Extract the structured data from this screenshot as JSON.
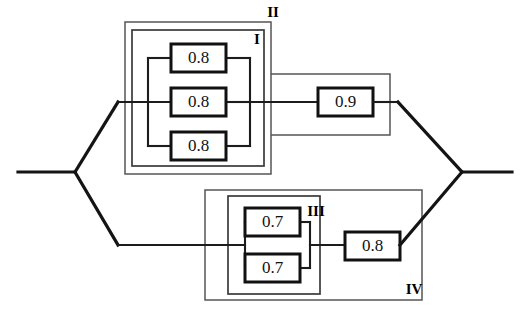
{
  "diagram": {
    "type": "reliability-block-diagram",
    "background_color": "#ffffff",
    "line_color": "#111111",
    "boundary_color": "#3a3a3a",
    "blocks": [
      {
        "id": "b1",
        "label": "0.8",
        "value": 0.8,
        "x": 171,
        "y": 44,
        "w": 55,
        "h": 28,
        "group": "I"
      },
      {
        "id": "b2",
        "label": "0.8",
        "value": 0.8,
        "x": 171,
        "y": 88,
        "w": 55,
        "h": 28,
        "group": "I"
      },
      {
        "id": "b3",
        "label": "0.8",
        "value": 0.8,
        "x": 171,
        "y": 132,
        "w": 55,
        "h": 28,
        "group": "I"
      },
      {
        "id": "b4",
        "label": "0.9",
        "value": 0.9,
        "x": 318,
        "y": 88,
        "w": 55,
        "h": 28,
        "group": "II"
      },
      {
        "id": "b5",
        "label": "0.7",
        "value": 0.7,
        "x": 245,
        "y": 208,
        "w": 55,
        "h": 28,
        "group": "III"
      },
      {
        "id": "b6",
        "label": "0.7",
        "value": 0.7,
        "x": 245,
        "y": 254,
        "w": 55,
        "h": 28,
        "group": "III"
      },
      {
        "id": "b7",
        "label": "0.8",
        "value": 0.8,
        "x": 345,
        "y": 232,
        "w": 55,
        "h": 28,
        "group": "IV"
      }
    ],
    "group_labels": [
      {
        "id": "I",
        "text": "I",
        "x": 257,
        "y": 41,
        "describes": "parallel set of three 0.8 blocks"
      },
      {
        "id": "II",
        "text": "II",
        "x": 273,
        "y": 14,
        "describes": "subsystem I in series with 0.9 block"
      },
      {
        "id": "III",
        "text": "III",
        "x": 316,
        "y": 213,
        "describes": "parallel pair of 0.7 blocks"
      },
      {
        "id": "IV",
        "text": "IV",
        "x": 414,
        "y": 291,
        "describes": "subsystem III in series with 0.8 block"
      }
    ],
    "boundaries": [
      {
        "id": "I",
        "x": 132,
        "y": 30,
        "w": 132,
        "h": 136
      },
      {
        "id": "II",
        "x": 125,
        "y": 22,
        "w": 146,
        "h": 152
      },
      {
        "id": "III",
        "x": 228,
        "y": 196,
        "w": 92,
        "h": 98
      },
      {
        "id": "IV",
        "x": 205,
        "y": 190,
        "w": 217,
        "h": 110
      }
    ],
    "nodes": {
      "input_start": {
        "x": 18,
        "y": 172
      },
      "split_node": {
        "x": 75,
        "y": 172
      },
      "merge_node": {
        "x": 462,
        "y": 172
      },
      "output_end": {
        "x": 512,
        "y": 172
      },
      "upper_rail_y": 102,
      "lower_rail_y": 245
    }
  }
}
